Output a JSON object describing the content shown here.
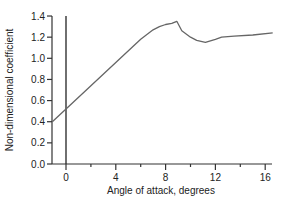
{
  "chart_data": {
    "type": "line",
    "title": "",
    "xlabel": "Angle of attack, degrees",
    "ylabel": "Non-dimensional coefficient",
    "xlim": [
      -1.1,
      16.6
    ],
    "ylim": [
      0.0,
      1.4
    ],
    "xticks": [
      0,
      4,
      8,
      12,
      16
    ],
    "xminor_ticks": [
      2,
      6,
      10,
      14
    ],
    "yticks": [
      0.0,
      0.2,
      0.4,
      0.6,
      0.8,
      1.0,
      1.2,
      1.4
    ],
    "ytick_labels": [
      "0.0",
      "0.2",
      "0.4",
      "0.6",
      "0.8",
      "1.0",
      "1.2",
      "1.4"
    ],
    "grid": false,
    "legend": null,
    "reference_lines": [
      {
        "type": "vertical",
        "x": 0
      }
    ],
    "series": [
      {
        "name": "coefficient",
        "color": "#666666",
        "x": [
          -1.1,
          0,
          2,
          4,
          6,
          7,
          7.5,
          8,
          8.5,
          8.9,
          9.3,
          10,
          10.5,
          11.2,
          12,
          12.5,
          13.5,
          15,
          16.6
        ],
        "y": [
          0.4,
          0.52,
          0.74,
          0.96,
          1.18,
          1.27,
          1.3,
          1.32,
          1.33,
          1.35,
          1.26,
          1.2,
          1.17,
          1.15,
          1.18,
          1.2,
          1.21,
          1.22,
          1.24
        ]
      }
    ]
  }
}
